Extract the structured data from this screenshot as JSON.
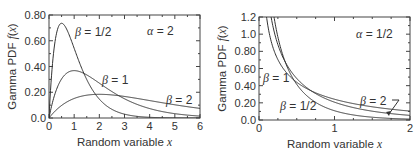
{
  "chart_data": [
    {
      "type": "line",
      "title": "",
      "xlabel": "Random variable x",
      "ylabel": "Gamma PDF f(x)",
      "xlim": [
        0,
        6
      ],
      "ylim": [
        0,
        0.8
      ],
      "xticks": [
        "0",
        "1",
        "2",
        "3",
        "4",
        "5",
        "6"
      ],
      "yticks": [
        "0.0",
        "0.20",
        "0.40",
        "0.60",
        "0.80"
      ],
      "annotation": "α = 2",
      "alpha": 2,
      "series": [
        {
          "name": "β = 1/2",
          "beta": 0.5,
          "x": [
            0,
            0.25,
            0.5,
            0.75,
            1,
            1.5,
            2,
            2.5,
            3,
            3.5,
            4,
            5,
            6
          ],
          "values": [
            0,
            0.59,
            0.74,
            0.67,
            0.54,
            0.3,
            0.15,
            0.07,
            0.03,
            0.013,
            0.005,
            0.001,
            0.0
          ]
        },
        {
          "name": "β = 1",
          "beta": 1,
          "x": [
            0,
            0.5,
            1,
            1.5,
            2,
            3,
            4,
            5,
            6
          ],
          "values": [
            0,
            0.3,
            0.37,
            0.33,
            0.27,
            0.15,
            0.07,
            0.03,
            0.015
          ]
        },
        {
          "name": "β = 2",
          "beta": 2,
          "x": [
            0,
            1,
            2,
            3,
            4,
            5,
            6
          ],
          "values": [
            0,
            0.15,
            0.18,
            0.17,
            0.14,
            0.1,
            0.07
          ]
        }
      ],
      "grid": false
    },
    {
      "type": "line",
      "title": "",
      "xlabel": "Random variable x",
      "ylabel": "Gamma PDF f(x)",
      "xlim": [
        0,
        2
      ],
      "ylim": [
        0,
        1.2
      ],
      "xticks": [
        "0",
        "1",
        "2"
      ],
      "yticks": [
        "0.0",
        "0.20",
        "0.40",
        "0.60",
        "0.80",
        "1.0",
        "1.2"
      ],
      "annotation": "α = 1/2",
      "alpha": 0.5,
      "series": [
        {
          "name": "β = 1/2",
          "beta": 0.5,
          "x": [
            0.15,
            0.25,
            0.5,
            1,
            1.5,
            2
          ],
          "values": [
            1.2,
            0.88,
            0.48,
            0.15,
            0.05,
            0.02
          ]
        },
        {
          "name": "β = 1",
          "beta": 1,
          "x": [
            0.17,
            0.25,
            0.5,
            1,
            1.5,
            2
          ],
          "values": [
            1.2,
            0.88,
            0.49,
            0.21,
            0.1,
            0.05
          ]
        },
        {
          "name": "β = 2",
          "beta": 2,
          "x": [
            0.19,
            0.25,
            0.5,
            1,
            1.5,
            2
          ],
          "values": [
            1.2,
            0.88,
            0.46,
            0.24,
            0.14,
            0.09
          ]
        }
      ],
      "grid": false
    }
  ]
}
